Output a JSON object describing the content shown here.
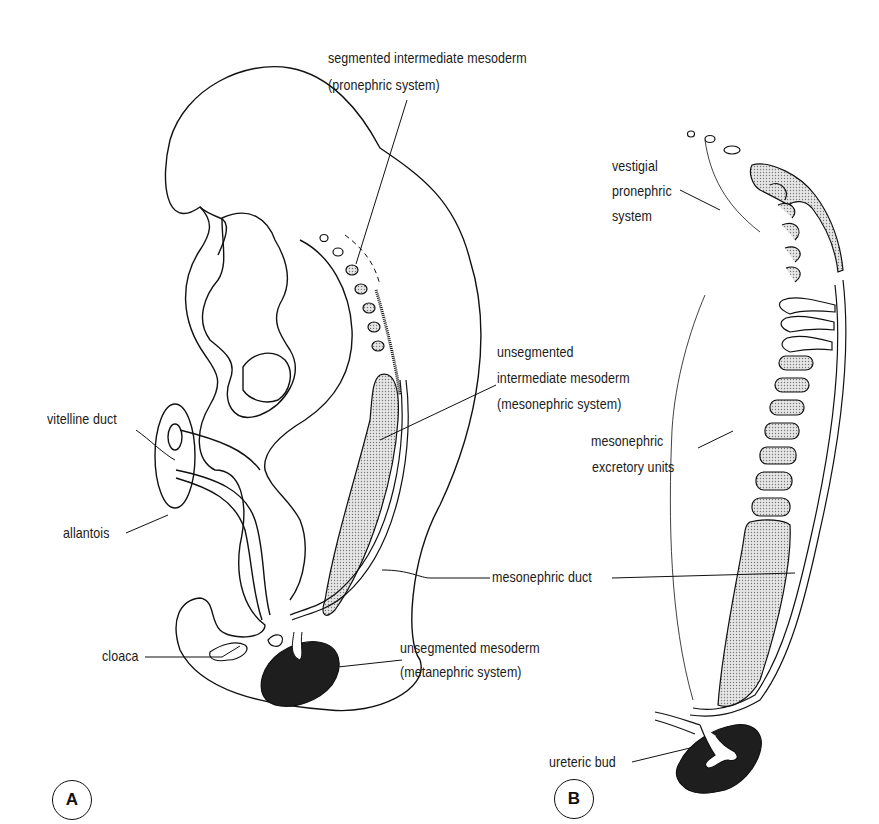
{
  "figure": {
    "panels": [
      {
        "id": "A",
        "label": "A"
      },
      {
        "id": "B",
        "label": "B"
      }
    ],
    "panel_a_labels": {
      "segmented_line1": "segmented intermediate mesoderm",
      "segmented_line2": "(pronephric system)",
      "unsegmented_im_line1": "unsegmented",
      "unsegmented_im_line2": "intermediate mesoderm",
      "unsegmented_im_line3": "(mesonephric system)",
      "vitelline_duct": "vitelline duct",
      "allantois": "allantois",
      "mesonephric_duct": "mesonephric duct",
      "cloaca": "cloaca",
      "unsegmented_m_line1": "unsegmented mesoderm",
      "unsegmented_m_line2": "(metanephric system)"
    },
    "panel_b_labels": {
      "vestigial_line1": "vestigial",
      "vestigial_line2": "pronephric",
      "vestigial_line3": "system",
      "excretory_line1": "mesonephric",
      "excretory_line2": "excretory units",
      "ureteric_bud": "ureteric bud"
    },
    "colors": {
      "ink": "#111111",
      "stipple": "#c9c9c9",
      "metanephros": "#141414",
      "background": "#ffffff"
    }
  }
}
